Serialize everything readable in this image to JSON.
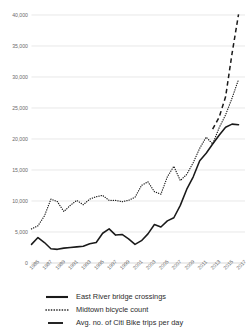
{
  "chart_data": {
    "type": "line",
    "title": "",
    "xlabel": "",
    "ylabel": "",
    "grid": true,
    "legend_position": "bottom",
    "ylim": [
      0,
      40000
    ],
    "yticks": [
      0,
      5000,
      10000,
      15000,
      20000,
      25000,
      30000,
      35000,
      40000
    ],
    "ytick_labels": [
      "0",
      "5,000",
      "10,000",
      "15,000",
      "20,000",
      "25,000",
      "30,000",
      "35,000",
      "40,000"
    ],
    "xlim": [
      1985,
      2018
    ],
    "xticks": [
      1985,
      1987,
      1989,
      1991,
      1993,
      1995,
      1997,
      1999,
      2001,
      2003,
      2005,
      2007,
      2009,
      2011,
      2013,
      2015,
      2017
    ],
    "xtick_labels": [
      "1985",
      "1987",
      "1989",
      "1991",
      "1993",
      "1995",
      "1997",
      "1999",
      "2001",
      "2003",
      "2005",
      "2007",
      "2009",
      "2011",
      "2013",
      "2015",
      "2017"
    ],
    "x": [
      1985,
      1986,
      1987,
      1988,
      1989,
      1990,
      1991,
      1992,
      1993,
      1994,
      1995,
      1996,
      1997,
      1998,
      1999,
      2000,
      2001,
      2002,
      2003,
      2004,
      2005,
      2006,
      2007,
      2008,
      2009,
      2010,
      2011,
      2012,
      2013,
      2014,
      2015,
      2016,
      2017
    ],
    "series": [
      {
        "name": "East River bridge crossings",
        "style": "solid",
        "color": "#1a1a1a",
        "values": [
          3000,
          4100,
          3300,
          2300,
          2200,
          2400,
          2500,
          2600,
          2700,
          3100,
          3300,
          4800,
          5500,
          4500,
          4600,
          3900,
          3000,
          3600,
          4700,
          6200,
          5800,
          6800,
          7300,
          9300,
          11900,
          13900,
          16500,
          17700,
          19200,
          20600,
          21900,
          22400,
          22300
        ],
        "ylim_note": "daily cyclists"
      },
      {
        "name": "Midtown bicycle count",
        "style": "dotted",
        "color": "#1a1a1a",
        "values": [
          5500,
          6000,
          7600,
          10300,
          9900,
          8300,
          9300,
          10100,
          9400,
          10300,
          10700,
          10900,
          10100,
          10100,
          9900,
          10100,
          10600,
          12500,
          13100,
          11500,
          11100,
          13900,
          15600,
          13300,
          14300,
          16200,
          18500,
          20300,
          19200,
          21800,
          23900,
          26600,
          29600
        ]
      },
      {
        "name": "Avg. no. of Citi Bike trips per day",
        "style": "dashed",
        "color": "#1a1a1a",
        "x_start": 2013,
        "x": [
          2013,
          2014,
          2015,
          2016,
          2017
        ],
        "values": [
          21600,
          23500,
          26800,
          33800,
          40100
        ]
      }
    ]
  },
  "legend": {
    "items": [
      {
        "label": "East River bridge crossings",
        "key": "solid-line-key"
      },
      {
        "label": "Midtown bicycle count",
        "key": "dotted-line-key"
      },
      {
        "label": "Avg. no. of Citi Bike trips per day",
        "key": "dashed-line-key"
      }
    ]
  }
}
